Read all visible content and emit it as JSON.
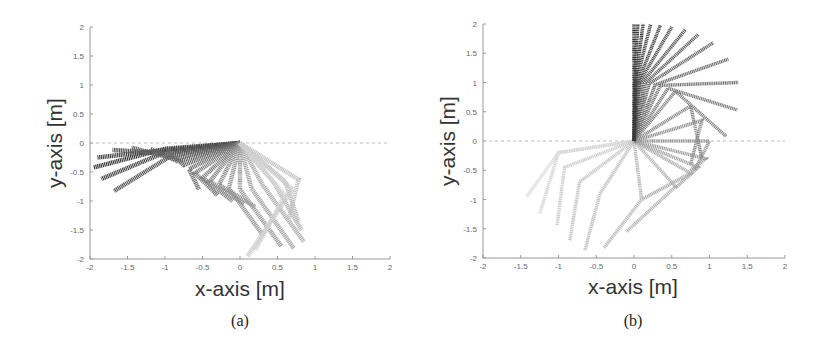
{
  "chart_data": [
    {
      "type": "line",
      "panel": "a",
      "caption": "(a)",
      "title": "",
      "xlabel": "x-axis [m]",
      "ylabel": "y-axis [m]",
      "xlim": [
        -2,
        2
      ],
      "ylim": [
        -2,
        2
      ],
      "xticks": [
        "-2",
        "-1.5",
        "-1",
        "-0.5",
        "0",
        "0.5",
        "1",
        "1.5",
        "2"
      ],
      "yticks": [
        "2",
        "1.5",
        "1",
        "0.5",
        "0",
        "-0.5",
        "-1",
        "-1.5",
        "-2"
      ],
      "grid": false,
      "reference_line": {
        "y": 0,
        "style": "dashed"
      },
      "description": "Sequence of two-link arm configurations (base at origin) drawn with gray shading from dark to light over time; arm swings from left (-1.9,-0.4) downward to right (0.8,-1.8)",
      "series": [
        {
          "name": "arm configurations",
          "points": [
            [
              [
                0,
                0
              ],
              [
                -1.0,
                -0.1
              ],
              [
                -1.95,
                -0.42
              ]
            ],
            [
              [
                0,
                0
              ],
              [
                -1.0,
                -0.12
              ],
              [
                -1.9,
                -0.25
              ]
            ],
            [
              [
                0,
                0
              ],
              [
                -0.98,
                -0.15
              ],
              [
                -1.85,
                -0.62
              ]
            ],
            [
              [
                0,
                0
              ],
              [
                -0.95,
                -0.18
              ],
              [
                -1.7,
                -0.12
              ]
            ],
            [
              [
                0,
                0
              ],
              [
                -0.92,
                -0.22
              ],
              [
                -1.68,
                -0.83
              ]
            ],
            [
              [
                0,
                0
              ],
              [
                -0.88,
                -0.27
              ],
              [
                -1.45,
                -0.08
              ]
            ],
            [
              [
                0,
                0
              ],
              [
                -0.82,
                -0.32
              ],
              [
                -1.2,
                -0.1
              ]
            ],
            [
              [
                0,
                0
              ],
              [
                -0.75,
                -0.38
              ],
              [
                -0.98,
                -0.12
              ]
            ],
            [
              [
                0,
                0
              ],
              [
                -0.68,
                -0.45
              ],
              [
                -0.55,
                -0.8
              ]
            ],
            [
              [
                0,
                0
              ],
              [
                -0.6,
                -0.52
              ],
              [
                -0.3,
                -0.9
              ]
            ],
            [
              [
                0,
                0
              ],
              [
                -0.5,
                -0.6
              ],
              [
                -0.1,
                -1.0
              ]
            ],
            [
              [
                0,
                0
              ],
              [
                -0.4,
                -0.66
              ],
              [
                0.05,
                -1.05
              ]
            ],
            [
              [
                0,
                0
              ],
              [
                -0.28,
                -0.72
              ],
              [
                0.2,
                -1.1
              ]
            ],
            [
              [
                0,
                0
              ],
              [
                -0.15,
                -0.78
              ],
              [
                0.3,
                -1.58
              ]
            ],
            [
              [
                0,
                0
              ],
              [
                0.0,
                -0.8
              ],
              [
                0.55,
                -1.78
              ]
            ],
            [
              [
                0,
                0
              ],
              [
                0.15,
                -0.78
              ],
              [
                0.72,
                -1.82
              ]
            ],
            [
              [
                0,
                0
              ],
              [
                0.3,
                -0.72
              ],
              [
                0.85,
                -1.7
              ]
            ],
            [
              [
                0,
                0
              ],
              [
                0.45,
                -0.68
              ],
              [
                0.82,
                -1.5
              ]
            ],
            [
              [
                0,
                0
              ],
              [
                0.6,
                -0.66
              ],
              [
                0.78,
                -1.35
              ]
            ],
            [
              [
                0,
                0
              ],
              [
                0.78,
                -0.63
              ],
              [
                0.65,
                -1.3
              ]
            ],
            [
              [
                0,
                0
              ],
              [
                0.7,
                -0.8
              ],
              [
                0.1,
                -1.95
              ]
            ],
            [
              [
                0,
                0
              ],
              [
                0.6,
                -0.9
              ],
              [
                0.2,
                -1.85
              ]
            ]
          ]
        }
      ]
    },
    {
      "type": "line",
      "panel": "b",
      "caption": "(b)",
      "title": "",
      "xlabel": "x-axis [m]",
      "ylabel": "y-axis [m]",
      "xlim": [
        -2,
        2
      ],
      "ylim": [
        -2,
        2
      ],
      "xticks": [
        "-2",
        "-1.5",
        "-1",
        "-0.5",
        "0",
        "0.5",
        "1",
        "1.5",
        "2"
      ],
      "yticks": [
        "2",
        "1.5",
        "1",
        "0.5",
        "0",
        "-0.5",
        "-1",
        "-1.5",
        "-2"
      ],
      "grid": false,
      "reference_line": {
        "y": 0,
        "style": "dashed"
      },
      "description": "Sequence of two-link arm configurations from hanging down-left (light) rotating counter-clockwise to vertical upright at (0,2) (dark)",
      "series": [
        {
          "name": "arm configurations",
          "points": [
            [
              [
                0,
                0
              ],
              [
                -1.0,
                -0.2
              ],
              [
                -1.42,
                -0.95
              ]
            ],
            [
              [
                0,
                0
              ],
              [
                -1.0,
                -0.2
              ],
              [
                -1.25,
                -1.25
              ]
            ],
            [
              [
                0,
                0
              ],
              [
                -0.92,
                -0.45
              ],
              [
                -1.02,
                -1.45
              ]
            ],
            [
              [
                0,
                0
              ],
              [
                -0.72,
                -0.7
              ],
              [
                -0.85,
                -1.7
              ]
            ],
            [
              [
                0,
                0
              ],
              [
                -0.45,
                -0.9
              ],
              [
                -0.65,
                -1.87
              ]
            ],
            [
              [
                0,
                0
              ],
              [
                0.1,
                -1.0
              ],
              [
                -0.4,
                -1.83
              ]
            ],
            [
              [
                0,
                0
              ],
              [
                0.55,
                -0.78
              ],
              [
                -0.1,
                -1.55
              ]
            ],
            [
              [
                0,
                0
              ],
              [
                0.75,
                -0.55
              ],
              [
                0.1,
                -1.0
              ]
            ],
            [
              [
                0,
                0
              ],
              [
                0.85,
                -0.45
              ],
              [
                0.55,
                -0.8
              ]
            ],
            [
              [
                0,
                0
              ],
              [
                0.95,
                -0.3
              ],
              [
                0.75,
                -0.5
              ]
            ],
            [
              [
                0,
                0
              ],
              [
                1.0,
                0.0
              ],
              [
                0.8,
                -0.5
              ]
            ],
            [
              [
                0,
                0
              ],
              [
                0.9,
                0.35
              ],
              [
                0.75,
                -0.4
              ]
            ],
            [
              [
                0,
                0
              ],
              [
                0.75,
                0.6
              ],
              [
                0.9,
                -0.3
              ]
            ],
            [
              [
                0,
                0
              ],
              [
                0.55,
                0.85
              ],
              [
                1.22,
                0.08
              ]
            ],
            [
              [
                0,
                0
              ],
              [
                0.45,
                0.9
              ],
              [
                1.37,
                0.53
              ]
            ],
            [
              [
                0,
                0
              ],
              [
                0.35,
                0.95
              ],
              [
                1.38,
                1.0
              ]
            ],
            [
              [
                0,
                0
              ],
              [
                0.28,
                0.96
              ],
              [
                1.25,
                1.4
              ]
            ],
            [
              [
                0,
                0
              ],
              [
                0.2,
                0.98
              ],
              [
                1.05,
                1.68
              ]
            ],
            [
              [
                0,
                0
              ],
              [
                0.15,
                0.99
              ],
              [
                0.85,
                1.82
              ]
            ],
            [
              [
                0,
                0
              ],
              [
                0.1,
                0.99
              ],
              [
                0.68,
                1.9
              ]
            ],
            [
              [
                0,
                0
              ],
              [
                0.07,
                1.0
              ],
              [
                0.5,
                1.95
              ]
            ],
            [
              [
                0,
                0
              ],
              [
                0.05,
                1.0
              ],
              [
                0.35,
                1.98
              ]
            ],
            [
              [
                0,
                0
              ],
              [
                0.03,
                1.0
              ],
              [
                0.22,
                2.0
              ]
            ],
            [
              [
                0,
                0
              ],
              [
                0.02,
                1.0
              ],
              [
                0.12,
                2.0
              ]
            ],
            [
              [
                0,
                0
              ],
              [
                0.01,
                1.0
              ],
              [
                0.05,
                2.0
              ]
            ],
            [
              [
                0,
                0
              ],
              [
                0.0,
                1.0
              ],
              [
                0.0,
                2.0
              ]
            ]
          ]
        }
      ]
    }
  ]
}
